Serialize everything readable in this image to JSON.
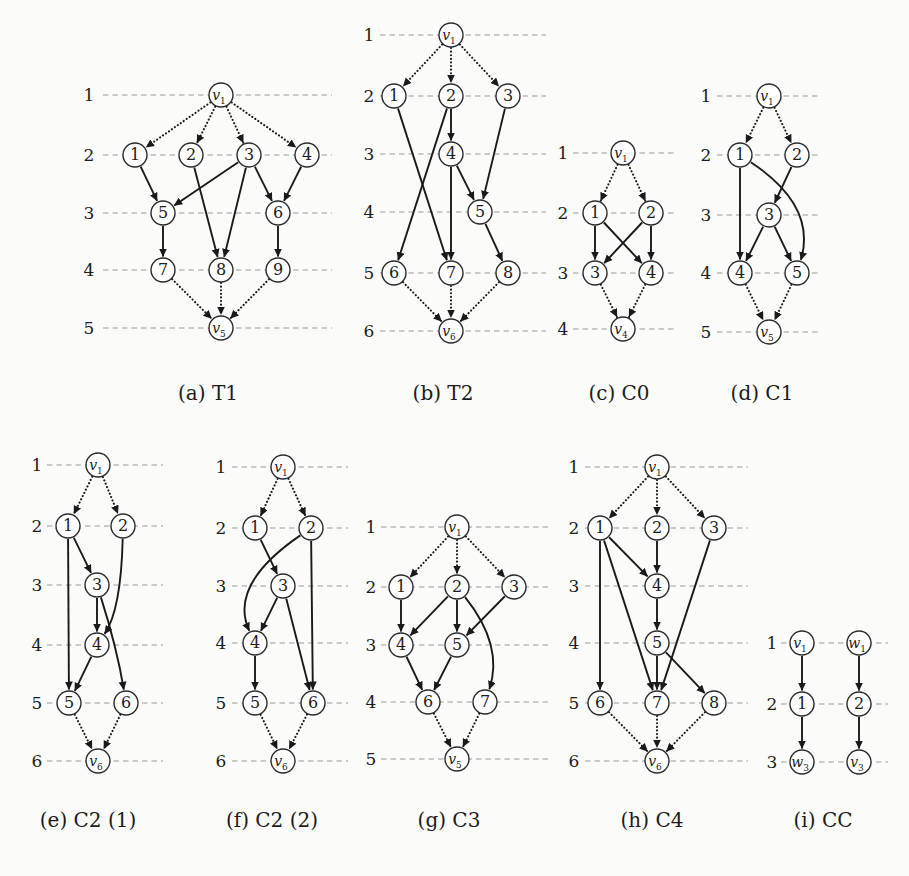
{
  "style": {
    "background": "#fbfbfa",
    "edge_color": "#1a1a1a",
    "node_fill": "#ffffff",
    "node_stroke": "#2b2b2b",
    "level_line_color": "#9b9b9b",
    "text_color": "#1c1c1c",
    "node_radius": 12
  },
  "figures": [
    {
      "id": "a",
      "name": "T1",
      "caption": "(a) T1",
      "label_x": 89,
      "line_x1": 103,
      "line_x2": 332,
      "levels": [
        {
          "n": "1",
          "y": 95
        },
        {
          "n": "2",
          "y": 155
        },
        {
          "n": "3",
          "y": 213
        },
        {
          "n": "4",
          "y": 270
        },
        {
          "n": "5",
          "y": 328
        }
      ],
      "nodes": [
        {
          "id": "v1",
          "t": "v",
          "sub": "1",
          "x": 221,
          "y": 95
        },
        {
          "id": "1",
          "t": "1",
          "x": 135,
          "y": 155
        },
        {
          "id": "2",
          "t": "2",
          "x": 191,
          "y": 155
        },
        {
          "id": "3",
          "t": "3",
          "x": 249,
          "y": 155
        },
        {
          "id": "4",
          "t": "4",
          "x": 307,
          "y": 155
        },
        {
          "id": "5",
          "t": "5",
          "x": 163,
          "y": 213
        },
        {
          "id": "6",
          "t": "6",
          "x": 278,
          "y": 213
        },
        {
          "id": "7",
          "t": "7",
          "x": 163,
          "y": 270
        },
        {
          "id": "8",
          "t": "8",
          "x": 221,
          "y": 270
        },
        {
          "id": "9",
          "t": "9",
          "x": 278,
          "y": 270
        },
        {
          "id": "v5",
          "t": "v",
          "sub": "5",
          "x": 221,
          "y": 328
        }
      ],
      "edges": [
        {
          "f": "v1",
          "t": "1",
          "s": "dotted"
        },
        {
          "f": "v1",
          "t": "2",
          "s": "dotted"
        },
        {
          "f": "v1",
          "t": "3",
          "s": "dotted"
        },
        {
          "f": "v1",
          "t": "4",
          "s": "dotted"
        },
        {
          "f": "1",
          "t": "5"
        },
        {
          "f": "3",
          "t": "5"
        },
        {
          "f": "2",
          "t": "8"
        },
        {
          "f": "3",
          "t": "8"
        },
        {
          "f": "3",
          "t": "6"
        },
        {
          "f": "4",
          "t": "6"
        },
        {
          "f": "5",
          "t": "7"
        },
        {
          "f": "6",
          "t": "9"
        },
        {
          "f": "7",
          "t": "v5",
          "s": "dotted"
        },
        {
          "f": "8",
          "t": "v5",
          "s": "dotted"
        },
        {
          "f": "9",
          "t": "v5",
          "s": "dotted"
        }
      ]
    },
    {
      "id": "b",
      "name": "T2",
      "caption": "(b) T2",
      "label_x": 369,
      "line_x1": 380,
      "line_x2": 546,
      "levels": [
        {
          "n": "1",
          "y": 35
        },
        {
          "n": "2",
          "y": 96
        },
        {
          "n": "3",
          "y": 154
        },
        {
          "n": "4",
          "y": 212
        },
        {
          "n": "5",
          "y": 273
        },
        {
          "n": "6",
          "y": 331
        }
      ],
      "nodes": [
        {
          "id": "v1",
          "t": "v",
          "sub": "1",
          "x": 451,
          "y": 35
        },
        {
          "id": "1",
          "t": "1",
          "x": 394,
          "y": 96
        },
        {
          "id": "2",
          "t": "2",
          "x": 451,
          "y": 96
        },
        {
          "id": "3",
          "t": "3",
          "x": 508,
          "y": 96
        },
        {
          "id": "4",
          "t": "4",
          "x": 451,
          "y": 154
        },
        {
          "id": "5",
          "t": "5",
          "x": 480,
          "y": 212
        },
        {
          "id": "6",
          "t": "6",
          "x": 394,
          "y": 273
        },
        {
          "id": "7",
          "t": "7",
          "x": 451,
          "y": 273
        },
        {
          "id": "8",
          "t": "8",
          "x": 508,
          "y": 273
        },
        {
          "id": "v6",
          "t": "v",
          "sub": "6",
          "x": 451,
          "y": 331
        }
      ],
      "edges": [
        {
          "f": "v1",
          "t": "1",
          "s": "dotted"
        },
        {
          "f": "v1",
          "t": "2",
          "s": "dotted"
        },
        {
          "f": "v1",
          "t": "3",
          "s": "dotted"
        },
        {
          "f": "2",
          "t": "4"
        },
        {
          "f": "1",
          "t": "7"
        },
        {
          "f": "2",
          "t": "6"
        },
        {
          "f": "3",
          "t": "5"
        },
        {
          "f": "4",
          "t": "5"
        },
        {
          "f": "4",
          "t": "7"
        },
        {
          "f": "5",
          "t": "8"
        },
        {
          "f": "6",
          "t": "v6",
          "s": "dotted"
        },
        {
          "f": "7",
          "t": "v6",
          "s": "dotted"
        },
        {
          "f": "8",
          "t": "v6",
          "s": "dotted"
        }
      ]
    },
    {
      "id": "c",
      "name": "C0",
      "caption": "(c) C0",
      "label_x": 563,
      "line_x1": 573,
      "line_x2": 676,
      "levels": [
        {
          "n": "1",
          "y": 153
        },
        {
          "n": "2",
          "y": 213
        },
        {
          "n": "3",
          "y": 273
        },
        {
          "n": "4",
          "y": 329
        }
      ],
      "nodes": [
        {
          "id": "v1",
          "t": "v",
          "sub": "1",
          "x": 623,
          "y": 153
        },
        {
          "id": "1",
          "t": "1",
          "x": 595,
          "y": 213
        },
        {
          "id": "2",
          "t": "2",
          "x": 651,
          "y": 213
        },
        {
          "id": "3",
          "t": "3",
          "x": 595,
          "y": 273
        },
        {
          "id": "4",
          "t": "4",
          "x": 651,
          "y": 273
        },
        {
          "id": "v4",
          "t": "v",
          "sub": "4",
          "x": 623,
          "y": 329
        }
      ],
      "edges": [
        {
          "f": "v1",
          "t": "1",
          "s": "dotted"
        },
        {
          "f": "v1",
          "t": "2",
          "s": "dotted"
        },
        {
          "f": "1",
          "t": "3"
        },
        {
          "f": "1",
          "t": "4"
        },
        {
          "f": "2",
          "t": "3"
        },
        {
          "f": "2",
          "t": "4"
        },
        {
          "f": "3",
          "t": "v4",
          "s": "dotted"
        },
        {
          "f": "4",
          "t": "v4",
          "s": "dotted"
        }
      ]
    },
    {
      "id": "d",
      "name": "C1",
      "caption": "(d) C1",
      "label_x": 706,
      "line_x1": 717,
      "line_x2": 820,
      "levels": [
        {
          "n": "1",
          "y": 96
        },
        {
          "n": "2",
          "y": 155
        },
        {
          "n": "3",
          "y": 215
        },
        {
          "n": "4",
          "y": 273
        },
        {
          "n": "5",
          "y": 332
        }
      ],
      "nodes": [
        {
          "id": "v1",
          "t": "v",
          "sub": "1",
          "x": 769,
          "y": 96
        },
        {
          "id": "1",
          "t": "1",
          "x": 740,
          "y": 155
        },
        {
          "id": "2",
          "t": "2",
          "x": 797,
          "y": 155
        },
        {
          "id": "3",
          "t": "3",
          "x": 769,
          "y": 215
        },
        {
          "id": "4",
          "t": "4",
          "x": 740,
          "y": 273
        },
        {
          "id": "5",
          "t": "5",
          "x": 797,
          "y": 273
        },
        {
          "id": "v5",
          "t": "v",
          "sub": "5",
          "x": 769,
          "y": 332
        }
      ],
      "edges": [
        {
          "f": "v1",
          "t": "1",
          "s": "dotted"
        },
        {
          "f": "v1",
          "t": "2",
          "s": "dotted"
        },
        {
          "f": "1",
          "t": "4"
        },
        {
          "f": "2",
          "t": "3"
        },
        {
          "f": "3",
          "t": "4"
        },
        {
          "f": "3",
          "t": "5"
        },
        {
          "f": "1",
          "t": "5",
          "cx": 817,
          "cy": 206
        },
        {
          "f": "4",
          "t": "v5",
          "s": "dotted"
        },
        {
          "f": "5",
          "t": "v5",
          "s": "dotted"
        }
      ]
    },
    {
      "id": "e",
      "name": "C2 (1)",
      "caption": "(e) C2 (1)",
      "label_x": 37,
      "line_x1": 47,
      "line_x2": 163,
      "levels": [
        {
          "n": "1",
          "y": 465
        },
        {
          "n": "2",
          "y": 526
        },
        {
          "n": "3",
          "y": 585
        },
        {
          "n": "4",
          "y": 645
        },
        {
          "n": "5",
          "y": 703
        },
        {
          "n": "6",
          "y": 761
        }
      ],
      "nodes": [
        {
          "id": "v1",
          "t": "v",
          "sub": "1",
          "x": 98,
          "y": 465
        },
        {
          "id": "1",
          "t": "1",
          "x": 68,
          "y": 526
        },
        {
          "id": "2",
          "t": "2",
          "x": 123,
          "y": 526
        },
        {
          "id": "3",
          "t": "3",
          "x": 97,
          "y": 585
        },
        {
          "id": "4",
          "t": "4",
          "x": 97,
          "y": 645
        },
        {
          "id": "5",
          "t": "5",
          "x": 69,
          "y": 703
        },
        {
          "id": "6",
          "t": "6",
          "x": 126,
          "y": 703
        },
        {
          "id": "v6",
          "t": "v",
          "sub": "6",
          "x": 98,
          "y": 761
        }
      ],
      "edges": [
        {
          "f": "v1",
          "t": "1",
          "s": "dotted"
        },
        {
          "f": "v1",
          "t": "2",
          "s": "dotted"
        },
        {
          "f": "1",
          "t": "3"
        },
        {
          "f": "1",
          "t": "5"
        },
        {
          "f": "3",
          "t": "4"
        },
        {
          "f": "4",
          "t": "5"
        },
        {
          "f": "2",
          "t": "4",
          "cx": 121,
          "cy": 610
        },
        {
          "f": "3",
          "t": "6",
          "cx": 117,
          "cy": 648
        },
        {
          "f": "5",
          "t": "v6",
          "s": "dotted"
        },
        {
          "f": "6",
          "t": "v6",
          "s": "dotted"
        }
      ]
    },
    {
      "id": "f",
      "name": "C2 (2)",
      "caption": "(f) C2 (2)",
      "label_x": 221,
      "line_x1": 232,
      "line_x2": 348,
      "levels": [
        {
          "n": "1",
          "y": 467
        },
        {
          "n": "2",
          "y": 528
        },
        {
          "n": "3",
          "y": 586
        },
        {
          "n": "4",
          "y": 643
        },
        {
          "n": "5",
          "y": 703
        },
        {
          "n": "6",
          "y": 761
        }
      ],
      "nodes": [
        {
          "id": "v1",
          "t": "v",
          "sub": "1",
          "x": 283,
          "y": 467
        },
        {
          "id": "1",
          "t": "1",
          "x": 255,
          "y": 528
        },
        {
          "id": "2",
          "t": "2",
          "x": 311,
          "y": 528
        },
        {
          "id": "3",
          "t": "3",
          "x": 283,
          "y": 586
        },
        {
          "id": "4",
          "t": "4",
          "x": 255,
          "y": 643
        },
        {
          "id": "5",
          "t": "5",
          "x": 255,
          "y": 703
        },
        {
          "id": "6",
          "t": "6",
          "x": 313,
          "y": 703
        },
        {
          "id": "v6",
          "t": "v",
          "sub": "6",
          "x": 283,
          "y": 761
        }
      ],
      "edges": [
        {
          "f": "v1",
          "t": "1",
          "s": "dotted"
        },
        {
          "f": "v1",
          "t": "2",
          "s": "dotted"
        },
        {
          "f": "1",
          "t": "3"
        },
        {
          "f": "2",
          "t": "6"
        },
        {
          "f": "3",
          "t": "4"
        },
        {
          "f": "3",
          "t": "6"
        },
        {
          "f": "4",
          "t": "5"
        },
        {
          "f": "2",
          "t": "4",
          "cx": 228,
          "cy": 585
        },
        {
          "f": "5",
          "t": "v6",
          "s": "dotted"
        },
        {
          "f": "6",
          "t": "v6",
          "s": "dotted"
        }
      ]
    },
    {
      "id": "g",
      "name": "C3",
      "caption": "(g) C3",
      "label_x": 371,
      "line_x1": 381,
      "line_x2": 549,
      "levels": [
        {
          "n": "1",
          "y": 527
        },
        {
          "n": "2",
          "y": 587
        },
        {
          "n": "3",
          "y": 645
        },
        {
          "n": "4",
          "y": 702
        },
        {
          "n": "5",
          "y": 759
        }
      ],
      "nodes": [
        {
          "id": "v1",
          "t": "v",
          "sub": "1",
          "x": 457,
          "y": 527
        },
        {
          "id": "1",
          "t": "1",
          "x": 401,
          "y": 587
        },
        {
          "id": "2",
          "t": "2",
          "x": 457,
          "y": 587
        },
        {
          "id": "3",
          "t": "3",
          "x": 514,
          "y": 587
        },
        {
          "id": "4",
          "t": "4",
          "x": 401,
          "y": 645
        },
        {
          "id": "5",
          "t": "5",
          "x": 457,
          "y": 645
        },
        {
          "id": "6",
          "t": "6",
          "x": 428,
          "y": 702
        },
        {
          "id": "7",
          "t": "7",
          "x": 485,
          "y": 702
        },
        {
          "id": "v5",
          "t": "v",
          "sub": "5",
          "x": 457,
          "y": 759
        }
      ],
      "edges": [
        {
          "f": "v1",
          "t": "1",
          "s": "dotted"
        },
        {
          "f": "v1",
          "t": "2",
          "s": "dotted"
        },
        {
          "f": "v1",
          "t": "3",
          "s": "dotted"
        },
        {
          "f": "1",
          "t": "4"
        },
        {
          "f": "2",
          "t": "4"
        },
        {
          "f": "2",
          "t": "5"
        },
        {
          "f": "3",
          "t": "5"
        },
        {
          "f": "4",
          "t": "6"
        },
        {
          "f": "5",
          "t": "6"
        },
        {
          "f": "2",
          "t": "7",
          "cx": 504,
          "cy": 646
        },
        {
          "f": "6",
          "t": "v5",
          "s": "dotted"
        },
        {
          "f": "7",
          "t": "v5",
          "s": "dotted"
        }
      ]
    },
    {
      "id": "h",
      "name": "C4",
      "caption": "(h) C4",
      "label_x": 574,
      "line_x1": 585,
      "line_x2": 748,
      "levels": [
        {
          "n": "1",
          "y": 467
        },
        {
          "n": "2",
          "y": 528
        },
        {
          "n": "3",
          "y": 586
        },
        {
          "n": "4",
          "y": 643
        },
        {
          "n": "5",
          "y": 703
        },
        {
          "n": "6",
          "y": 761
        }
      ],
      "nodes": [
        {
          "id": "v1",
          "t": "v",
          "sub": "1",
          "x": 657,
          "y": 467
        },
        {
          "id": "1",
          "t": "1",
          "x": 600,
          "y": 528
        },
        {
          "id": "2",
          "t": "2",
          "x": 657,
          "y": 528
        },
        {
          "id": "3",
          "t": "3",
          "x": 714,
          "y": 528
        },
        {
          "id": "4",
          "t": "4",
          "x": 657,
          "y": 586
        },
        {
          "id": "5",
          "t": "5",
          "x": 657,
          "y": 643
        },
        {
          "id": "6",
          "t": "6",
          "x": 600,
          "y": 703
        },
        {
          "id": "7",
          "t": "7",
          "x": 657,
          "y": 703
        },
        {
          "id": "8",
          "t": "8",
          "x": 714,
          "y": 703
        },
        {
          "id": "v6",
          "t": "v",
          "sub": "6",
          "x": 657,
          "y": 761
        }
      ],
      "edges": [
        {
          "f": "v1",
          "t": "1",
          "s": "dotted"
        },
        {
          "f": "v1",
          "t": "2",
          "s": "dotted"
        },
        {
          "f": "v1",
          "t": "3",
          "s": "dotted"
        },
        {
          "f": "1",
          "t": "4"
        },
        {
          "f": "2",
          "t": "4"
        },
        {
          "f": "1",
          "t": "6"
        },
        {
          "f": "1",
          "t": "7"
        },
        {
          "f": "3",
          "t": "7"
        },
        {
          "f": "4",
          "t": "5"
        },
        {
          "f": "5",
          "t": "7"
        },
        {
          "f": "5",
          "t": "8"
        },
        {
          "f": "6",
          "t": "v6",
          "s": "dotted"
        },
        {
          "f": "7",
          "t": "v6",
          "s": "dotted"
        },
        {
          "f": "8",
          "t": "v6",
          "s": "dotted"
        }
      ]
    },
    {
      "id": "i",
      "name": "CC",
      "caption": "(i) CC",
      "label_x": 772,
      "line_x1": 781,
      "line_x2": 888,
      "levels": [
        {
          "n": "1",
          "y": 643
        },
        {
          "n": "2",
          "y": 704
        },
        {
          "n": "3",
          "y": 762
        }
      ],
      "nodes": [
        {
          "id": "v1",
          "t": "v",
          "sub": "1",
          "x": 802,
          "y": 643
        },
        {
          "id": "w1",
          "t": "w",
          "sub": "1",
          "x": 859,
          "y": 643
        },
        {
          "id": "1",
          "t": "1",
          "x": 802,
          "y": 704
        },
        {
          "id": "2",
          "t": "2",
          "x": 859,
          "y": 704
        },
        {
          "id": "w3",
          "t": "w",
          "sub": "3",
          "x": 802,
          "y": 762
        },
        {
          "id": "v3",
          "t": "v",
          "sub": "3",
          "x": 859,
          "y": 762
        }
      ],
      "edges": [
        {
          "f": "v1",
          "t": "1"
        },
        {
          "f": "w1",
          "t": "2"
        },
        {
          "f": "1",
          "t": "w3"
        },
        {
          "f": "2",
          "t": "v3"
        }
      ]
    }
  ]
}
